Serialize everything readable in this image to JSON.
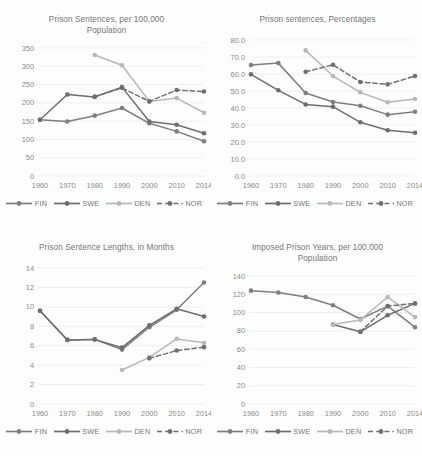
{
  "figure": {
    "background": "#fdfdfd",
    "series_colors": {
      "FIN": "#7f7f7f",
      "SWE": "#6e6e6e",
      "DEN": "#b8b8b8",
      "NOR": "#707070"
    },
    "legend": [
      {
        "key": "FIN",
        "label": "FIN",
        "style": "solid",
        "color": "#7f7f7f"
      },
      {
        "key": "SWE",
        "label": "SWE",
        "style": "solid",
        "color": "#6e6e6e"
      },
      {
        "key": "DEN",
        "label": "DEN",
        "style": "solid",
        "color": "#b8b8b8"
      },
      {
        "key": "NOR",
        "label": "NOR",
        "style": "dashed",
        "color": "#707070"
      }
    ]
  },
  "chart_data": [
    {
      "id": "prison-sentences-per-100000",
      "type": "line",
      "title": "Prison Sentences, per 100,000 Population",
      "title_lines": [
        "Prison Sentences, per 100,000",
        "Population"
      ],
      "xlabel": "",
      "ylabel": "",
      "categories": [
        "1960",
        "1970",
        "1980",
        "1990",
        "2000",
        "2010",
        "2014"
      ],
      "yticks": [
        0,
        50,
        100,
        150,
        200,
        250,
        300,
        350
      ],
      "ytick_labels": [
        "0",
        "50",
        "100",
        "150",
        "200",
        "250",
        "300",
        "350"
      ],
      "ylim": [
        0,
        350
      ],
      "grid": true,
      "legend_position": "bottom",
      "series": [
        {
          "name": "FIN",
          "style": "solid",
          "color": "#7f7f7f",
          "values": [
            154,
            149,
            165,
            186,
            144,
            122,
            95
          ]
        },
        {
          "name": "SWE",
          "style": "solid",
          "color": "#6e6e6e",
          "values": [
            154,
            223,
            216,
            243,
            149,
            140,
            117
          ]
        },
        {
          "name": "DEN",
          "style": "solid",
          "color": "#b8b8b8",
          "values": [
            null,
            null,
            331,
            303,
            204,
            213,
            173
          ]
        },
        {
          "name": "NOR",
          "style": "dashed",
          "color": "#707070",
          "values": [
            null,
            null,
            217,
            241,
            204,
            235,
            231
          ]
        }
      ]
    },
    {
      "id": "prison-sentences-percentages",
      "type": "line",
      "title": "Prison sentences, Percentages",
      "title_lines": [
        "Prison sentences, Percentages"
      ],
      "xlabel": "",
      "ylabel": "",
      "categories": [
        "1960",
        "1970",
        "1980",
        "1990",
        "2000",
        "2010",
        "2014"
      ],
      "yticks": [
        0.0,
        10.0,
        20.0,
        30.0,
        40.0,
        50.0,
        60.0,
        70.0,
        80.0
      ],
      "ytick_labels": [
        "0.0",
        "10.0",
        "20.0",
        "30.0",
        "40.0",
        "50.0",
        "60.0",
        "70.0",
        "80.0"
      ],
      "ylim": [
        0,
        80
      ],
      "grid": true,
      "legend_position": "bottom",
      "series": [
        {
          "name": "FIN",
          "style": "solid",
          "color": "#7f7f7f",
          "values": [
            65.3,
            66.4,
            48.8,
            43.5,
            41.3,
            36.1,
            37.8
          ]
        },
        {
          "name": "SWE",
          "style": "solid",
          "color": "#6e6e6e",
          "values": [
            59.8,
            50.4,
            42.1,
            40.8,
            31.6,
            26.9,
            25.4
          ]
        },
        {
          "name": "DEN",
          "style": "solid",
          "color": "#b8b8b8",
          "values": [
            null,
            null,
            73.9,
            58.8,
            49.2,
            43.4,
            45.3
          ]
        },
        {
          "name": "NOR",
          "style": "dashed",
          "color": "#707070",
          "values": [
            null,
            null,
            61.3,
            65.4,
            55.3,
            53.9,
            58.8
          ]
        }
      ]
    },
    {
      "id": "prison-sentence-lengths-months",
      "type": "line",
      "title": "Prison Sentence Lengths, in Months",
      "title_lines": [
        "Prison Sentence Lengths, in Months"
      ],
      "xlabel": "",
      "ylabel": "",
      "categories": [
        "1960",
        "1970",
        "1980",
        "1990",
        "2000",
        "2010",
        "2014"
      ],
      "yticks": [
        0,
        2,
        4,
        6,
        8,
        10,
        12,
        14
      ],
      "ytick_labels": [
        "0",
        "2",
        "4",
        "6",
        "8",
        "10",
        "12",
        "14"
      ],
      "ylim": [
        0,
        14
      ],
      "grid": true,
      "legend_position": "bottom",
      "series": [
        {
          "name": "FIN",
          "style": "solid",
          "color": "#7f7f7f",
          "values": [
            9.6,
            6.6,
            6.65,
            5.6,
            7.9,
            9.7,
            12.5
          ]
        },
        {
          "name": "SWE",
          "style": "solid",
          "color": "#6e6e6e",
          "values": [
            9.6,
            6.6,
            6.65,
            5.8,
            8.1,
            9.8,
            9.0
          ]
        },
        {
          "name": "DEN",
          "style": "solid",
          "color": "#b8b8b8",
          "values": [
            null,
            null,
            null,
            3.5,
            4.8,
            6.7,
            6.3
          ]
        },
        {
          "name": "NOR",
          "style": "dashed",
          "color": "#707070",
          "values": [
            null,
            null,
            null,
            null,
            4.7,
            5.5,
            5.85
          ]
        }
      ]
    },
    {
      "id": "imposed-prison-years-per-100000",
      "type": "line",
      "title": "Imposed Prison Years, per 100,000 Population",
      "title_lines": [
        "Imposed Prison Years, per 100,000",
        "Population"
      ],
      "xlabel": "",
      "ylabel": "",
      "categories": [
        "1960",
        "1970",
        "1980",
        "1990",
        "2000",
        "2010",
        "2014"
      ],
      "yticks": [
        0,
        20,
        40,
        60,
        80,
        100,
        120,
        140
      ],
      "ytick_labels": [
        "0",
        "20",
        "40",
        "60",
        "80",
        "100",
        "120",
        "140"
      ],
      "ylim": [
        0,
        140
      ],
      "grid": true,
      "legend_position": "bottom",
      "series": [
        {
          "name": "FIN",
          "style": "solid",
          "color": "#7f7f7f",
          "values": [
            124,
            122,
            117,
            108,
            93,
            107,
            84
          ]
        },
        {
          "name": "SWE",
          "style": "solid",
          "color": "#6e6e6e",
          "values": [
            null,
            null,
            null,
            87,
            79,
            97,
            110
          ]
        },
        {
          "name": "DEN",
          "style": "solid",
          "color": "#b8b8b8",
          "values": [
            null,
            null,
            null,
            87,
            92,
            117,
            95
          ]
        },
        {
          "name": "NOR",
          "style": "dashed",
          "color": "#707070",
          "values": [
            null,
            null,
            null,
            null,
            79,
            107,
            110
          ]
        }
      ]
    }
  ]
}
